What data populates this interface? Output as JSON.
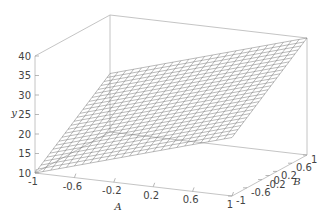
{
  "chart_data": {
    "type": "surface3d",
    "title": "",
    "xlabel": "A",
    "ylabel": "B",
    "zlabel": "y",
    "x_ticks": [
      "-1",
      "-0.6",
      "-0.2",
      "0.2",
      "0.6",
      "1"
    ],
    "y_ticks": [
      "-1",
      "-0.6",
      "-0.2",
      "0",
      "0.2",
      "0.6",
      "1"
    ],
    "z_ticks": [
      "10",
      "15",
      "20",
      "25",
      "30",
      "35",
      "40"
    ],
    "xlim": [
      -1,
      1
    ],
    "ylim": [
      -1,
      1
    ],
    "zlim": [
      10,
      40
    ],
    "surface": {
      "description": "planar mesh surface, y increases with A and B",
      "corners": [
        {
          "A": -1,
          "B": -1,
          "y": 10
        },
        {
          "A": 1,
          "B": -1,
          "y": 25
        },
        {
          "A": -1,
          "B": 1,
          "y": 25
        },
        {
          "A": 1,
          "B": 1,
          "y": 40
        }
      ],
      "grid_lines": 25
    },
    "grid": false,
    "legend": null
  }
}
